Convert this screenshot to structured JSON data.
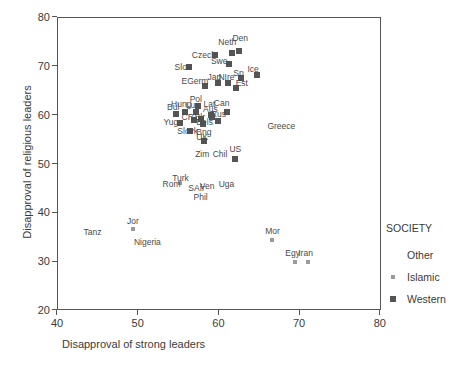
{
  "chart_data": {
    "type": "scatter",
    "title": "",
    "xlabel": "Disapproval of strong leaders",
    "ylabel": "Disapproval of religious leaders",
    "xlim": [
      40,
      80
    ],
    "ylim": [
      20,
      80
    ],
    "xticks": [
      40,
      50,
      60,
      70,
      80
    ],
    "yticks": [
      20,
      30,
      40,
      50,
      60,
      70,
      80
    ],
    "grid": false,
    "legend": {
      "title": "SOCIETY",
      "position": "right",
      "entries": [
        {
          "label": "Other",
          "marker": "none",
          "color": "#8d8d8d"
        },
        {
          "label": "Islamic",
          "marker": "small-square",
          "color": "#9a9a9a"
        },
        {
          "label": "Western",
          "marker": "square",
          "color": "#545454"
        }
      ]
    },
    "colors": {
      "western": "#545454",
      "islamic": "#9a9a9a",
      "other": "#8d8d8d",
      "axis": "#555555"
    },
    "points": [
      {
        "label": "Den",
        "x": 62.6,
        "y": 73.0,
        "society": "Western",
        "lx": 62.7,
        "ly": 75.6
      },
      {
        "label": "Neth",
        "x": 61.7,
        "y": 72.6,
        "society": "Western",
        "lx": 61.1,
        "ly": 74.8
      },
      {
        "label": "Czech",
        "x": 59.6,
        "y": 72.2,
        "society": "Western",
        "lx": 58.2,
        "ly": 72.2
      },
      {
        "label": "Swe",
        "x": 61.3,
        "y": 70.3,
        "society": "Western",
        "lx": 60.1,
        "ly": 70.9
      },
      {
        "label": "Slov",
        "x": 56.4,
        "y": 69.7,
        "society": "Western",
        "lx": 55.6,
        "ly": 69.7
      },
      {
        "label": "Ice",
        "x": 64.8,
        "y": 68.1,
        "society": "Western",
        "lx": 64.3,
        "ly": 69.3
      },
      {
        "label": "Sp",
        "x": 62.8,
        "y": 67.5,
        "society": "Western",
        "lx": 62.5,
        "ly": 68.6
      },
      {
        "label": "NIre",
        "x": 61.2,
        "y": 66.5,
        "society": "Western",
        "lx": 61.0,
        "ly": 67.8
      },
      {
        "label": "Jap",
        "x": 59.9,
        "y": 66.4,
        "society": "Western",
        "lx": 59.5,
        "ly": 67.8
      },
      {
        "label": "EGerm",
        "x": 58.4,
        "y": 65.9,
        "society": "Western",
        "lx": 57.1,
        "ly": 66.9
      },
      {
        "label": "Est",
        "x": 62.2,
        "y": 65.4,
        "society": "Western",
        "lx": 62.9,
        "ly": 66.4
      },
      {
        "label": "Can",
        "x": 61.1,
        "y": 60.5,
        "society": "Western",
        "lx": 60.4,
        "ly": 62.3
      },
      {
        "label": "Lat",
        "x": 59.1,
        "y": 60.0,
        "society": "Western",
        "lx": 58.9,
        "ly": 62.2
      },
      {
        "label": "Pol",
        "x": 57.5,
        "y": 61.8,
        "society": "Western",
        "lx": 57.2,
        "ly": 63.3
      },
      {
        "label": "Lux",
        "x": 57.2,
        "y": 60.5,
        "society": "Western",
        "lx": 56.8,
        "ly": 62.0
      },
      {
        "label": "Hung",
        "x": 55.9,
        "y": 60.6,
        "society": "Western",
        "lx": 55.4,
        "ly": 62.1
      },
      {
        "label": "Bul",
        "x": 54.8,
        "y": 60.1,
        "society": "Western",
        "lx": 54.4,
        "ly": 61.5
      },
      {
        "label": "Aus",
        "x": 59.2,
        "y": 59.6,
        "society": "Western",
        "lx": 59.0,
        "ly": 61.2
      },
      {
        "label": "Rus",
        "x": 60.0,
        "y": 58.8,
        "society": "Western",
        "lx": 60.0,
        "ly": 60.1
      },
      {
        "label": "CR",
        "x": 57.0,
        "y": 59.0,
        "society": "Western",
        "lx": 56.2,
        "ly": 59.5
      },
      {
        "label": "Blr",
        "x": 57.9,
        "y": 59.1,
        "society": "Western",
        "lx": 57.7,
        "ly": 59.6
      },
      {
        "label": "Bels",
        "x": 58.1,
        "y": 58.0,
        "society": "Western",
        "lx": 58.3,
        "ly": 58.4
      },
      {
        "label": "Yug",
        "x": 55.2,
        "y": 58.3,
        "society": "Western",
        "lx": 54.1,
        "ly": 58.5
      },
      {
        "label": "Slovk",
        "x": 56.5,
        "y": 56.6,
        "society": "Western",
        "lx": 56.2,
        "ly": 56.6
      },
      {
        "label": "Bng",
        "x": 58.1,
        "y": 56.2,
        "society": "Other",
        "lx": 58.2,
        "ly": 56.4
      },
      {
        "label": "UK",
        "x": 58.2,
        "y": 54.7,
        "society": "Western",
        "lx": 58.0,
        "ly": 55.5
      },
      {
        "label": "US",
        "x": 62.1,
        "y": 51.0,
        "society": "Western",
        "lx": 62.1,
        "ly": 53.0
      },
      {
        "label": "Chil",
        "x": 60.2,
        "y": 52.0,
        "society": "Other",
        "lx": 60.2,
        "ly": 52.0
      },
      {
        "label": "Zim",
        "x": 58.0,
        "y": 51.9,
        "society": "Other",
        "lx": 58.0,
        "ly": 51.9
      },
      {
        "label": "Greece",
        "x": 67.8,
        "y": 57.6,
        "society": "Other",
        "lx": 67.8,
        "ly": 57.6
      },
      {
        "label": "Turk",
        "x": 55.3,
        "y": 46.0,
        "society": "Islamic",
        "lx": 55.3,
        "ly": 47.0
      },
      {
        "label": "Rom",
        "x": 54.7,
        "y": 45.5,
        "society": "Other",
        "lx": 54.2,
        "ly": 45.7
      },
      {
        "label": "SAfr",
        "x": 57.3,
        "y": 44.9,
        "society": "Other",
        "lx": 57.3,
        "ly": 44.9
      },
      {
        "label": "Ven",
        "x": 58.6,
        "y": 45.3,
        "society": "Other",
        "lx": 58.6,
        "ly": 45.3
      },
      {
        "label": "Uga",
        "x": 61.0,
        "y": 45.8,
        "society": "Other",
        "lx": 61.0,
        "ly": 45.8
      },
      {
        "label": "Phil",
        "x": 57.8,
        "y": 43.2,
        "society": "Other",
        "lx": 57.8,
        "ly": 43.2
      },
      {
        "label": "Jor",
        "x": 49.4,
        "y": 36.6,
        "society": "Islamic",
        "lx": 49.4,
        "ly": 38.3
      },
      {
        "label": "Tanz",
        "x": 44.4,
        "y": 35.9,
        "society": "Other",
        "lx": 44.4,
        "ly": 35.9
      },
      {
        "label": "Nigeria",
        "x": 51.2,
        "y": 33.9,
        "society": "Other",
        "lx": 51.2,
        "ly": 33.9
      },
      {
        "label": "Mor",
        "x": 66.7,
        "y": 34.4,
        "society": "Islamic",
        "lx": 66.7,
        "ly": 36.2
      },
      {
        "label": "Egy",
        "x": 69.5,
        "y": 29.9,
        "society": "Islamic",
        "lx": 69.2,
        "ly": 31.7
      },
      {
        "label": "Iran",
        "x": 71.1,
        "y": 29.9,
        "society": "Islamic",
        "lx": 70.8,
        "ly": 31.7
      }
    ]
  }
}
